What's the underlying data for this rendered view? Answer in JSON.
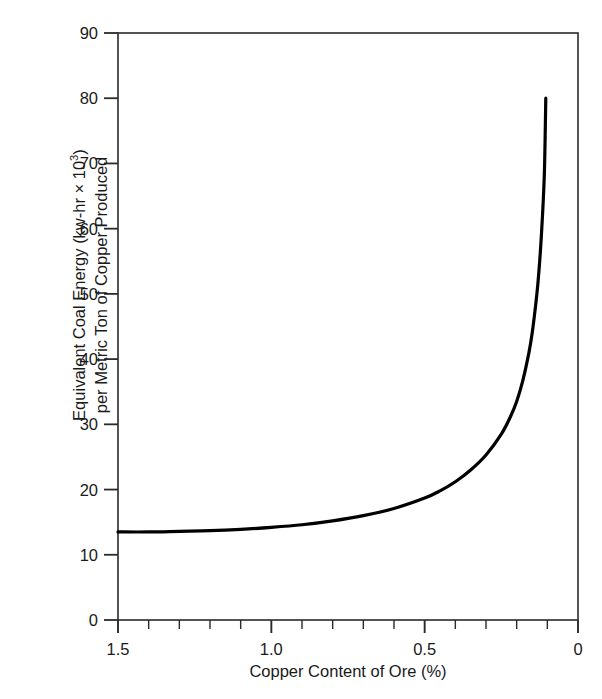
{
  "chart_data": {
    "type": "line",
    "title": "",
    "xlabel": "Copper Content of Ore (%)",
    "ylabel_line1": "Equivalent Coal Energy (kw-hr × 10",
    "ylabel_sup": "3",
    "ylabel_line1_tail": ")",
    "ylabel_line2": "per Metric Ton of Copper Produced",
    "xlim": [
      1.5,
      0.0
    ],
    "ylim": [
      0,
      90
    ],
    "x_axis_inverted": true,
    "grid": false,
    "legend": "none",
    "x_tick_labels": [
      "1.5",
      "1.0",
      "0.5",
      "0"
    ],
    "x_tick_label_values": [
      1.5,
      1.0,
      0.5,
      0.0
    ],
    "x_minor_tick_values": [
      1.5,
      1.4,
      1.3,
      1.2,
      1.1,
      1.0,
      0.9,
      0.8,
      0.7,
      0.6,
      0.5,
      0.4,
      0.3,
      0.2,
      0.1,
      0.0
    ],
    "y_tick_labels": [
      "0",
      "10",
      "20",
      "30",
      "40",
      "50",
      "60",
      "70",
      "80",
      "90"
    ],
    "y_tick_values": [
      0,
      10,
      20,
      30,
      40,
      50,
      60,
      70,
      80,
      90
    ],
    "series": [
      {
        "name": "Equivalent coal energy",
        "color": "#000000",
        "line_width": 3.2,
        "x": [
          1.5,
          1.4,
          1.3,
          1.2,
          1.1,
          1.0,
          0.9,
          0.8,
          0.7,
          0.6,
          0.5,
          0.45,
          0.4,
          0.35,
          0.3,
          0.25,
          0.22,
          0.2,
          0.18,
          0.16,
          0.15,
          0.14,
          0.13,
          0.12,
          0.11,
          0.105
        ],
        "y": [
          13.5,
          13.5,
          13.6,
          13.7,
          13.9,
          14.2,
          14.6,
          15.2,
          16.0,
          17.1,
          18.7,
          19.8,
          21.2,
          23.0,
          25.3,
          28.5,
          31.2,
          33.5,
          36.7,
          41.0,
          43.8,
          47.5,
          52.0,
          58.5,
          68.0,
          80.0
        ]
      }
    ],
    "axis_color": "#2a2a2a",
    "background": "#ffffff"
  },
  "plot_area": {
    "left": 118,
    "right": 578,
    "top": 33,
    "bottom": 620
  }
}
